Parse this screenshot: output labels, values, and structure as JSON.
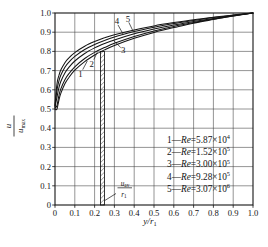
{
  "figure": {
    "bg": "#ffffff",
    "ink": "#141414",
    "grid_color": "#3c3c3c"
  },
  "chart_data": {
    "type": "line",
    "title": "",
    "xlabel": "y/r1",
    "ylabel": "u/umax",
    "xlabel_parts": {
      "main": "y/r",
      "sub": "1"
    },
    "ylabel_parts": {
      "num": "u",
      "den": "u",
      "den_sub": "max"
    },
    "xlim": [
      0,
      1
    ],
    "ylim": [
      0,
      1
    ],
    "grid": true,
    "legend_position": "inside-bottom-right",
    "tick_values": [
      0,
      0.1,
      0.2,
      0.3,
      0.4,
      0.5,
      0.6,
      0.7,
      0.8,
      0.9,
      1
    ],
    "tick_labels": [
      "0",
      "0.1",
      "0.2",
      "0.3",
      "0.4",
      "0.5",
      "0.6",
      "0.7",
      "0.8",
      "0.9",
      "1.0"
    ],
    "x": [
      0,
      0.01,
      0.02,
      0.03,
      0.05,
      0.07,
      0.1,
      0.15,
      0.2,
      0.25,
      0.3,
      0.4,
      0.5,
      0.6,
      0.7,
      0.8,
      0.9,
      1.0
    ],
    "series": [
      {
        "name": "1",
        "legend": {
          "prefix": "1",
          "dash": "—",
          "variable": "Re",
          "value": "=5.87×10",
          "exponent": "4"
        },
        "values": [
          0.5,
          0.5,
          0.548,
          0.583,
          0.631,
          0.664,
          0.702,
          0.747,
          0.781,
          0.808,
          0.831,
          0.868,
          0.899,
          0.924,
          0.947,
          0.966,
          0.984,
          1.0
        ]
      },
      {
        "name": "2",
        "legend": {
          "prefix": "2",
          "dash": "—",
          "variable": "Re",
          "value": "=1.52×10",
          "exponent": "5"
        },
        "values": [
          0.505,
          0.518,
          0.572,
          0.606,
          0.652,
          0.684,
          0.72,
          0.763,
          0.795,
          0.82,
          0.842,
          0.877,
          0.906,
          0.93,
          0.95,
          0.969,
          0.985,
          1.0
        ]
      },
      {
        "name": "3",
        "legend": {
          "prefix": "3",
          "dash": "—",
          "variable": "Re",
          "value": "=3.00×10",
          "exponent": "5"
        },
        "values": [
          0.51,
          0.562,
          0.613,
          0.645,
          0.688,
          0.717,
          0.75,
          0.789,
          0.818,
          0.841,
          0.86,
          0.892,
          0.917,
          0.938,
          0.956,
          0.972,
          0.987,
          1.0
        ]
      },
      {
        "name": "4",
        "legend": {
          "prefix": "4",
          "dash": "—",
          "variable": "Re",
          "value": "=9.28×10",
          "exponent": "5"
        },
        "values": [
          0.515,
          0.599,
          0.648,
          0.677,
          0.717,
          0.744,
          0.774,
          0.81,
          0.836,
          0.857,
          0.875,
          0.903,
          0.926,
          0.945,
          0.961,
          0.976,
          0.988,
          1.0
        ]
      },
      {
        "name": "5",
        "legend": {
          "prefix": "5",
          "dash": "—",
          "variable": "Re",
          "value": "=3.07×10",
          "exponent": "6"
        },
        "values": [
          0.52,
          0.631,
          0.676,
          0.704,
          0.741,
          0.766,
          0.794,
          0.827,
          0.851,
          0.871,
          0.887,
          0.912,
          0.933,
          0.95,
          0.965,
          0.978,
          0.99,
          1.0
        ]
      }
    ],
    "curve_labels": [
      {
        "text": "1",
        "x": 0.128,
        "y": 0.683,
        "line": [
          0.14,
          0.705,
          0.163,
          0.75
        ]
      },
      {
        "text": "2",
        "x": 0.186,
        "y": 0.736,
        "line": [
          0.196,
          0.757,
          0.214,
          0.797
        ]
      },
      {
        "text": "3",
        "x": 0.344,
        "y": 0.805,
        "line": [
          0.332,
          0.82,
          0.295,
          0.858
        ]
      },
      {
        "text": "4",
        "x": 0.313,
        "y": 0.957,
        "line": [
          0.318,
          0.938,
          0.344,
          0.89
        ]
      },
      {
        "text": "5",
        "x": 0.368,
        "y": 0.971,
        "line": [
          0.373,
          0.951,
          0.394,
          0.906
        ]
      }
    ],
    "band": {
      "x0": 0.23,
      "x1": 0.25,
      "y0": 0,
      "y1": 0.8,
      "label": {
        "num": "u",
        "num_sub": "av",
        "den": "r",
        "den_sub": "1"
      }
    }
  }
}
